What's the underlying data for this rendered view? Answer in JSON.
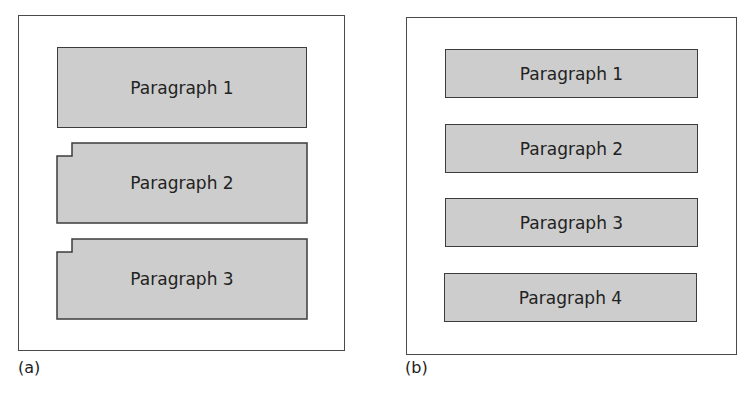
{
  "panels": [
    {
      "caption": "(a)",
      "paragraphs": [
        {
          "label": "Paragraph 1",
          "indented": false
        },
        {
          "label": "Paragraph 2",
          "indented": true
        },
        {
          "label": "Paragraph 3",
          "indented": true
        }
      ]
    },
    {
      "caption": "(b)",
      "paragraphs": [
        {
          "label": "Paragraph 1"
        },
        {
          "label": "Paragraph 2"
        },
        {
          "label": "Paragraph 3"
        },
        {
          "label": "Paragraph 4"
        }
      ]
    }
  ],
  "colors": {
    "box_fill": "#cdcdcd",
    "box_stroke": "#3c3c3c",
    "frame_stroke": "#4a4a4a"
  }
}
